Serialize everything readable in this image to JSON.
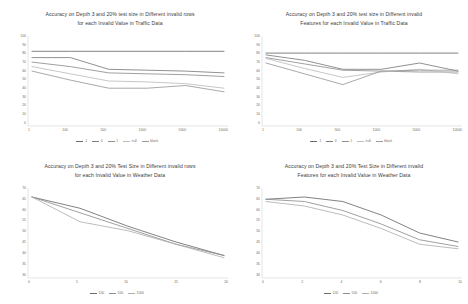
{
  "figure": {
    "background": "#ffffff",
    "axis_color": "#c9c9c9",
    "text_color": "#6e6e6e"
  },
  "chart_data": [
    {
      "id": "traffic-rows",
      "type": "line",
      "title": "Accuracy on Depth 3 and 20% test size in Different invalid rows\nfor each Invalid Value in Traffic Data",
      "xlabel": "",
      "ylabel": "",
      "grid": false,
      "legend_position": "bottom",
      "categories": [
        "1",
        "100",
        "500",
        "1000",
        "5000",
        "10000"
      ],
      "yticks": [
        "100",
        "90",
        "80",
        "70",
        "60",
        "50",
        "40",
        "30",
        "20",
        "10",
        "0"
      ],
      "ylim": [
        0,
        100
      ],
      "series": [
        {
          "name": "-1",
          "color": "#6b6b6b",
          "values": [
            83,
            83,
            83,
            83,
            83,
            83
          ]
        },
        {
          "name": "0",
          "color": "#7d7d7d",
          "values": [
            76,
            76,
            63,
            62,
            61,
            59
          ]
        },
        {
          "name": "1",
          "color": "#8f8f8f",
          "values": [
            71,
            66,
            59,
            58,
            57,
            55
          ]
        },
        {
          "name": "null",
          "color": "#bdbdbd",
          "values": [
            66,
            58,
            50,
            49,
            47,
            42
          ]
        },
        {
          "name": "blank",
          "color": "#9a9a9a",
          "values": [
            61,
            51,
            42,
            42,
            45,
            38
          ]
        }
      ]
    },
    {
      "id": "traffic-features",
      "type": "line",
      "title": "Accuracy on Depth 3 and 20% test size in Different invalid\nFeatures for each Invalid Value in Traffic Data",
      "xlabel": "",
      "ylabel": "",
      "grid": false,
      "legend_position": "bottom",
      "categories": [
        "1",
        "100",
        "500",
        "1000",
        "5000",
        "10000"
      ],
      "yticks": [
        "100",
        "90",
        "80",
        "70",
        "60",
        "50",
        "40",
        "30",
        "20",
        "10",
        "0"
      ],
      "ylim": [
        0,
        100
      ],
      "series": [
        {
          "name": "-1",
          "color": "#6b6b6b",
          "values": [
            81,
            81,
            81,
            81,
            81,
            81
          ]
        },
        {
          "name": "0",
          "color": "#7d7d7d",
          "values": [
            79,
            73,
            63,
            63,
            70,
            61
          ]
        },
        {
          "name": "1",
          "color": "#8f8f8f",
          "values": [
            76,
            69,
            62,
            61,
            60,
            60
          ]
        },
        {
          "name": "null",
          "color": "#bdbdbd",
          "values": [
            75,
            64,
            54,
            60,
            63,
            58
          ]
        },
        {
          "name": "blank",
          "color": "#9a9a9a",
          "values": [
            70,
            58,
            46,
            61,
            62,
            62
          ]
        }
      ]
    },
    {
      "id": "weather-rows",
      "type": "line",
      "title": "Accuracy on Depth 3 and 20% Test Size in Different invalid rows\nfor each Invalid Value in Weather Data",
      "xlabel": "",
      "ylabel": "",
      "grid": false,
      "legend_position": "bottom",
      "categories": [
        "0",
        "5",
        "10",
        "15",
        "20"
      ],
      "yticks": [
        "70",
        "65",
        "60",
        "55",
        "50",
        "45",
        "40",
        "35",
        "30"
      ],
      "ylim": [
        30,
        70
      ],
      "series": [
        {
          "name": "100",
          "color": "#6b6b6b",
          "values": [
            66,
            61,
            53,
            46,
            40
          ]
        },
        {
          "name": "500",
          "color": "#8f8f8f",
          "values": [
            66,
            59,
            52,
            45,
            40
          ]
        },
        {
          "name": "1000",
          "color": "#b0b0b0",
          "values": [
            66,
            55,
            51,
            45,
            39
          ]
        }
      ]
    },
    {
      "id": "weather-features",
      "type": "line",
      "title": "Accuracy on Depth 3 and 20% Test Size in Different invalid\nFeatures for each Invalid Value in Weather Data",
      "xlabel": "",
      "ylabel": "",
      "grid": false,
      "legend_position": "bottom",
      "categories": [
        "0",
        "2",
        "4",
        "6",
        "8",
        "10"
      ],
      "yticks": [
        "70",
        "65",
        "60",
        "55",
        "50",
        "45",
        "40",
        "35",
        "30"
      ],
      "ylim": [
        30,
        70
      ],
      "series": [
        {
          "name": "100",
          "color": "#6b6b6b",
          "values": [
            65,
            66,
            64,
            58,
            50,
            46
          ]
        },
        {
          "name": "500",
          "color": "#8f8f8f",
          "values": [
            65,
            64,
            60,
            54,
            47,
            44
          ]
        },
        {
          "name": "1000",
          "color": "#b0b0b0",
          "values": [
            64,
            62,
            58,
            52,
            45,
            43
          ]
        }
      ]
    }
  ]
}
